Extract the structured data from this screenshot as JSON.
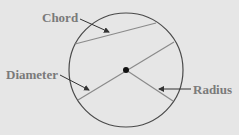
{
  "diagram": {
    "labels": {
      "chord": "Chord",
      "diameter": "Diameter",
      "radius": "Radius"
    },
    "colors": {
      "background": "#e6e6e6",
      "circle": "#4a4a4a",
      "lines": "#8a8a8a",
      "label": "#7a7a7a",
      "center": "#111111"
    }
  }
}
